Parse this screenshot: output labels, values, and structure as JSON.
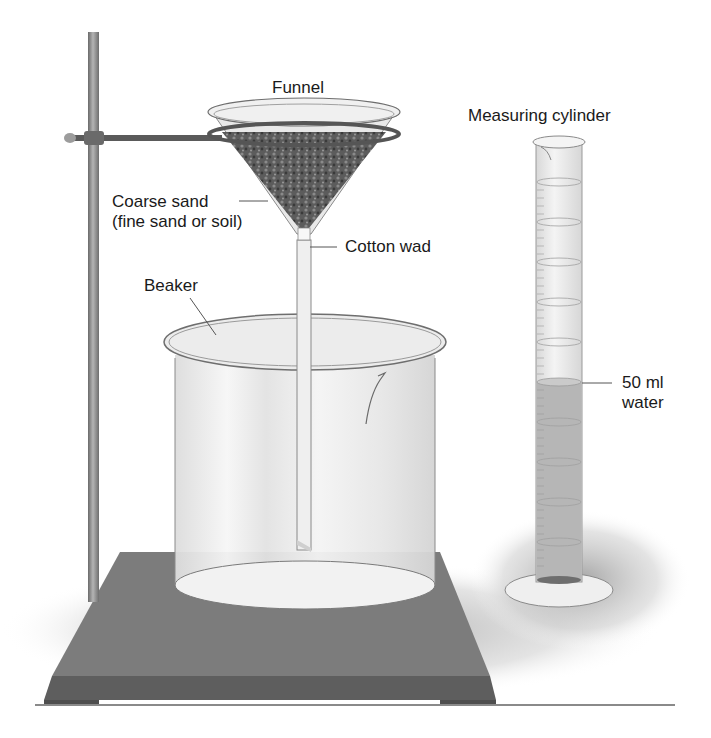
{
  "diagram": {
    "labels": {
      "funnel": "Funnel",
      "measuring_cylinder": "Measuring cylinder",
      "coarse_sand_line1": "Coarse sand",
      "coarse_sand_line2": "(fine sand or soil)",
      "cotton_wad": "Cotton wad",
      "beaker": "Beaker",
      "water_line1": "50 ml",
      "water_line2": "water"
    },
    "components": [
      "ring stand",
      "clamp ring",
      "funnel",
      "sand",
      "cotton wad",
      "funnel stem",
      "beaker",
      "base plate",
      "measuring cylinder",
      "water"
    ],
    "colors": {
      "stand": "#8c8c8c",
      "base": "#6e6e6e",
      "sand": "#5a5a5a",
      "water": "#b9b9b9",
      "glass": "#ececec",
      "outline": "#7a7a7a",
      "text": "#1a1a1a",
      "rule": "#8a8a8a"
    }
  }
}
